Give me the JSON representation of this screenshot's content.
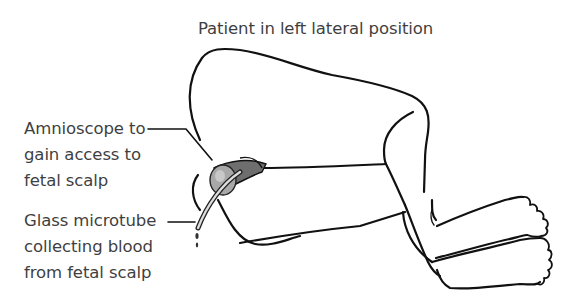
{
  "figure": {
    "title": "Patient in left lateral position",
    "labels": {
      "amnioscope": [
        "Amnioscope to",
        "gain access to",
        "fetal scalp"
      ],
      "microtube": [
        "Glass microtube",
        "collecting blood",
        "from fetal scalp"
      ]
    }
  },
  "colors": {
    "line": "#111111",
    "text": "#3f3f3f",
    "amnioscope_fill": "#9a9a9a",
    "background": "#ffffff"
  }
}
